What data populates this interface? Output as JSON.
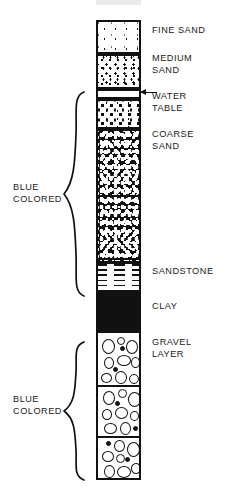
{
  "diagram": {
    "ink_color": "#111111",
    "background": "#ffffff"
  },
  "column": {
    "layers": [
      {
        "id": "fine-sand",
        "label": "FINE SAND",
        "pattern": "sparse-fine-dots",
        "top": 0,
        "height": 34
      },
      {
        "id": "medium-sand",
        "label": "MEDIUM\nSAND",
        "pattern": "medium-dots",
        "top": 35,
        "height": 34
      },
      {
        "id": "water-table",
        "label": "WATER\nTABLE",
        "pattern": "blank-band",
        "top": 70,
        "height": 9
      },
      {
        "id": "coarse-upper",
        "label": "COARSE\nSAND",
        "pattern": "coarse-dots",
        "top": 80,
        "height": 29
      },
      {
        "id": "coarse-sand",
        "label": "",
        "pattern": "dense-mottled-black",
        "top": 110,
        "height": 132
      },
      {
        "id": "sandstone",
        "label": "SANDSTONE",
        "pattern": "horizontal-lines",
        "top": 243,
        "height": 29
      },
      {
        "id": "clay",
        "label": "CLAY",
        "pattern": "solid-black",
        "top": 273,
        "height": 38
      },
      {
        "id": "gravel-layer",
        "label": "GRAVEL\nLAYER",
        "pattern": "outlined-pebbles",
        "top": 312,
        "height": 148
      }
    ]
  },
  "right_labels": [
    {
      "name": "fine-sand-label",
      "text": "FINE SAND",
      "top": 25
    },
    {
      "name": "medium-sand-label",
      "text": "MEDIUM\nSAND",
      "top": 53
    },
    {
      "name": "water-table-label",
      "text": "WATER\nTABLE",
      "top": 91
    },
    {
      "name": "coarse-sand-label",
      "text": "COARSE\nSAND",
      "top": 129
    },
    {
      "name": "sandstone-label",
      "text": "SANDSTONE",
      "top": 266
    },
    {
      "name": "clay-label",
      "text": "CLAY",
      "top": 301
    },
    {
      "name": "gravel-label",
      "text": "GRAVEL\nLAYER",
      "top": 337
    }
  ],
  "left_annotations": [
    {
      "name": "blue-colored-upper",
      "text": "BLUE\nCOLORED",
      "top": 182,
      "brace_top": 92,
      "brace_height": 204
    },
    {
      "name": "blue-colored-lower",
      "text": "BLUE\nCOLORED",
      "top": 394,
      "brace_top": 342,
      "brace_height": 138
    }
  ],
  "water_table_pointer": {
    "name": "water-table-arrow",
    "direction": "left",
    "target_layer": "water-table"
  }
}
